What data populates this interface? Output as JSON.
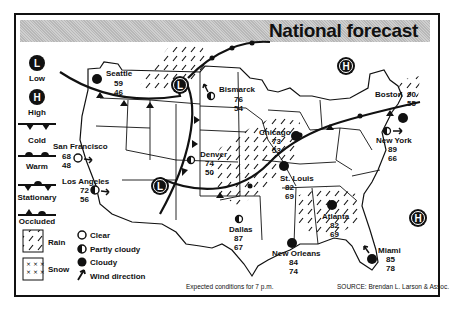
{
  "title": "National forecast",
  "legend": {
    "pressure": [
      {
        "symbol": "L",
        "label": "Low"
      },
      {
        "symbol": "H",
        "label": "High"
      }
    ],
    "fronts": [
      {
        "type": "cold",
        "label": "Cold"
      },
      {
        "type": "warm",
        "label": "Warm"
      },
      {
        "type": "stationary",
        "label": "Stationary"
      },
      {
        "type": "occluded",
        "label": "Occluded"
      }
    ],
    "precip": [
      {
        "type": "rain",
        "label": "Rain"
      },
      {
        "type": "snow",
        "label": "Snow"
      }
    ],
    "sky": [
      {
        "type": "clear",
        "label": "Clear"
      },
      {
        "type": "partly-cloudy",
        "label": "Partly cloudy"
      },
      {
        "type": "cloudy",
        "label": "Cloudy"
      },
      {
        "type": "wind",
        "label": "Wind direction"
      }
    ]
  },
  "cities": [
    {
      "name": "Seattle",
      "high": "59",
      "low": "46",
      "sky": "cloudy"
    },
    {
      "name": "Bismarck",
      "high": "76",
      "low": "54",
      "sky": "partly-cloudy"
    },
    {
      "name": "San Francisco",
      "high": "68",
      "low": "48",
      "sky": "clear"
    },
    {
      "name": "Los Angeles",
      "high": "72",
      "low": "56",
      "sky": "partly-cloudy"
    },
    {
      "name": "Denver",
      "high": "74",
      "low": "50",
      "sky": "partly-cloudy"
    },
    {
      "name": "Chicago",
      "high": "73",
      "low": "53",
      "sky": "cloudy"
    },
    {
      "name": "St. Louis",
      "high": "82",
      "low": "69",
      "sky": "cloudy"
    },
    {
      "name": "Dallas",
      "high": "87",
      "low": "67",
      "sky": "partly-cloudy"
    },
    {
      "name": "New Orleans",
      "high": "84",
      "low": "74",
      "sky": "cloudy"
    },
    {
      "name": "Atlanta",
      "high": "82",
      "low": "69",
      "sky": "cloudy"
    },
    {
      "name": "Miami",
      "high": "85",
      "low": "78",
      "sky": "cloudy"
    },
    {
      "name": "Boston",
      "high": "90",
      "low": "55",
      "sky": "cloudy"
    },
    {
      "name": "New York",
      "high": "89",
      "low": "66",
      "sky": "partly-cloudy"
    }
  ],
  "pressure_centers": [
    {
      "symbol": "L",
      "location": "northern Rockies"
    },
    {
      "symbol": "L",
      "location": "Four Corners"
    },
    {
      "symbol": "H",
      "location": "Great Lakes north"
    },
    {
      "symbol": "H",
      "location": "Atlantic"
    }
  ],
  "footer": {
    "note": "Expected conditions for 7 p.m.",
    "source": "SOURCE: Brendan L. Larson & Assoc."
  }
}
